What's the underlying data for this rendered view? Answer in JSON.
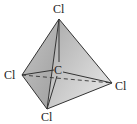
{
  "diagram": {
    "central_atom": "C",
    "atoms": [
      {
        "id": "top",
        "label": "Cl"
      },
      {
        "id": "left",
        "label": "Cl"
      },
      {
        "id": "right",
        "label": "Cl"
      },
      {
        "id": "bottom",
        "label": "Cl"
      }
    ],
    "colors": {
      "face_dark": "#b8b8b8",
      "face_mid": "#d0d0d0",
      "face_light": "#e4e4e4",
      "edge": "#333333"
    }
  }
}
